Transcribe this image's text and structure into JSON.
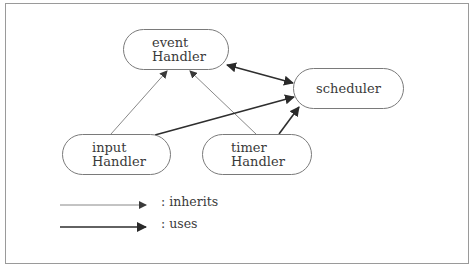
{
  "diagram": {
    "nodes": [
      {
        "id": "event",
        "line1": "event",
        "line2": "Handler"
      },
      {
        "id": "scheduler",
        "line1": "scheduler"
      },
      {
        "id": "input",
        "line1": "input",
        "line2": "Handler"
      },
      {
        "id": "timer",
        "line1": "timer",
        "line2": "Handler"
      }
    ],
    "edges": [
      {
        "from": "input",
        "to": "event",
        "type": "inherits"
      },
      {
        "from": "timer",
        "to": "event",
        "type": "inherits"
      },
      {
        "from": "event",
        "to": "scheduler",
        "type": "uses",
        "bidirectional": true
      },
      {
        "from": "input",
        "to": "scheduler",
        "type": "uses"
      },
      {
        "from": "timer",
        "to": "scheduler",
        "type": "uses"
      }
    ],
    "legend": {
      "inherits": ": inherits",
      "uses": ": uses"
    },
    "colors": {
      "inherits_line": "#6e6e6e",
      "uses_line": "#2e2e2e",
      "node_border": "#7a7a7a",
      "frame_border": "#9a9a9a"
    }
  }
}
